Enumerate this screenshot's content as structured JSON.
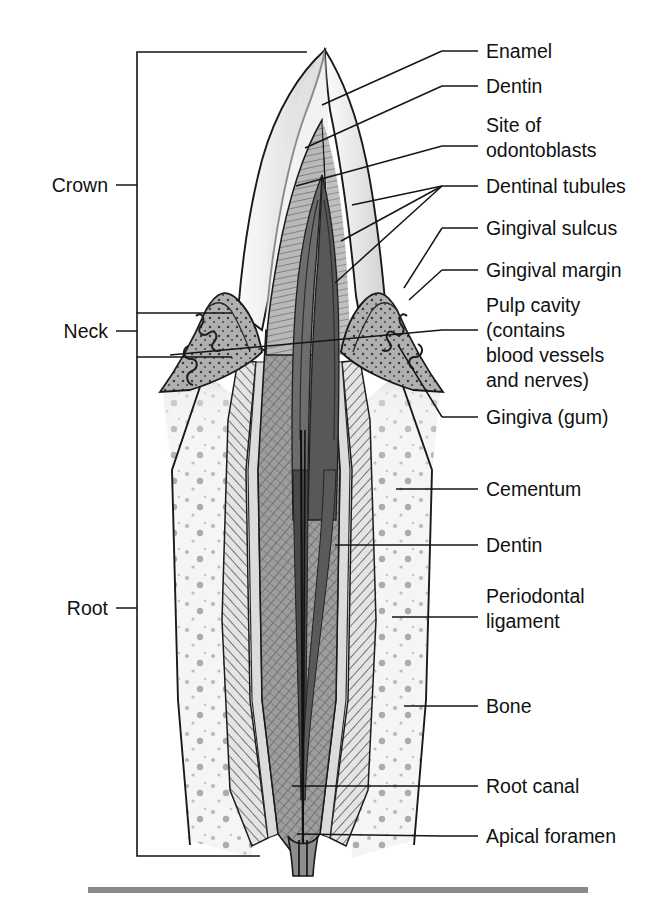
{
  "figure": {
    "background": "#ffffff",
    "ink": "#151515",
    "rule_color": "#8a8a8a"
  },
  "labels_right": [
    {
      "key": "enamel",
      "text": "Enamel",
      "lines": [
        "Enamel"
      ],
      "x": 486,
      "y": 58,
      "dash_x1": 442,
      "dash_x2": 478,
      "dash_y": 51
    },
    {
      "key": "dentin-crown",
      "text": "Dentin",
      "lines": [
        "Dentin"
      ],
      "x": 486,
      "y": 93,
      "dash_x1": 442,
      "dash_x2": 478,
      "dash_y": 86
    },
    {
      "key": "site-odontoblasts",
      "text": "Site of odontoblasts",
      "lines": [
        "Site of",
        "odontoblasts"
      ],
      "x": 486,
      "y": 132,
      "dash_x1": 442,
      "dash_x2": 478,
      "dash_y": 146
    },
    {
      "key": "dentinal-tubules",
      "text": "Dentinal tubules",
      "lines": [
        "Dentinal tubules"
      ],
      "x": 486,
      "y": 193,
      "dash_x1": 442,
      "dash_x2": 478,
      "dash_y": 186
    },
    {
      "key": "gingival-sulcus",
      "text": "Gingival sulcus",
      "lines": [
        "Gingival sulcus"
      ],
      "x": 486,
      "y": 235,
      "dash_x1": 442,
      "dash_x2": 478,
      "dash_y": 228
    },
    {
      "key": "gingival-margin",
      "text": "Gingival margin",
      "lines": [
        "Gingival margin"
      ],
      "x": 486,
      "y": 277,
      "dash_x1": 442,
      "dash_x2": 478,
      "dash_y": 270
    },
    {
      "key": "pulp-cavity",
      "text": "Pulp cavity (contains blood vessels and nerves)",
      "lines": [
        "Pulp cavity",
        "(contains",
        "blood vessels",
        "and nerves)"
      ],
      "x": 486,
      "y": 312,
      "dash_x1": 442,
      "dash_x2": 478,
      "dash_y": 330
    },
    {
      "key": "gingiva",
      "text": "Gingiva (gum)",
      "lines": [
        "Gingiva (gum)"
      ],
      "x": 486,
      "y": 424,
      "dash_x1": 442,
      "dash_x2": 478,
      "dash_y": 417
    },
    {
      "key": "cementum",
      "text": "Cementum",
      "lines": [
        "Cementum"
      ],
      "x": 486,
      "y": 496,
      "dash_x1": 442,
      "dash_x2": 478,
      "dash_y": 489
    },
    {
      "key": "dentin-root",
      "text": "Dentin",
      "lines": [
        "Dentin"
      ],
      "x": 486,
      "y": 552,
      "dash_x1": 442,
      "dash_x2": 478,
      "dash_y": 545
    },
    {
      "key": "periodontal-ligament",
      "text": "Periodontal ligament",
      "lines": [
        "Periodontal",
        "ligament"
      ],
      "x": 486,
      "y": 603,
      "dash_x1": 442,
      "dash_x2": 478,
      "dash_y": 617
    },
    {
      "key": "bone",
      "text": "Bone",
      "lines": [
        "Bone"
      ],
      "x": 486,
      "y": 713,
      "dash_x1": 442,
      "dash_x2": 478,
      "dash_y": 706
    },
    {
      "key": "root-canal",
      "text": "Root canal",
      "lines": [
        "Root canal"
      ],
      "x": 486,
      "y": 793,
      "dash_x1": 442,
      "dash_x2": 478,
      "dash_y": 786
    },
    {
      "key": "apical-foramen",
      "text": "Apical foramen",
      "lines": [
        "Apical foramen"
      ],
      "x": 486,
      "y": 843,
      "dash_x1": 442,
      "dash_x2": 478,
      "dash_y": 836
    }
  ],
  "labels_left": [
    {
      "key": "crown",
      "text": "Crown",
      "x": 108,
      "y": 192,
      "tick_x1": 116,
      "tick_x2": 137,
      "tick_y": 185
    },
    {
      "key": "neck",
      "text": "Neck",
      "x": 108,
      "y": 338,
      "tick_x1": 116,
      "tick_x2": 137,
      "tick_y": 331
    },
    {
      "key": "root",
      "text": "Root",
      "x": 108,
      "y": 615,
      "tick_x1": 116,
      "tick_x2": 137,
      "tick_y": 608
    }
  ],
  "brackets": [
    {
      "key": "crown-bracket",
      "d": "M 307 52 L 137 52 L 137 313"
    },
    {
      "key": "neck-bracket",
      "d": "M 232 313 L 137 313 L 137 357 L 232 357"
    },
    {
      "key": "root-bracket",
      "d": "M 137 357 L 137 856 L 260 856"
    }
  ],
  "leaders": [
    {
      "key": "leader-enamel",
      "d": "M 442 51 L 322 105"
    },
    {
      "key": "leader-dentin-crown",
      "d": "M 442 86 L 305 148"
    },
    {
      "key": "leader-odontoblasts",
      "d": "M 442 146 L 296 186"
    },
    {
      "key": "leader-tubules-a",
      "d": "M 442 186 L 352 205"
    },
    {
      "key": "leader-tubules-b",
      "d": "M 442 186 L 341 241"
    },
    {
      "key": "leader-tubules-c",
      "d": "M 442 186 L 335 283"
    },
    {
      "key": "leader-gingival-sulcus",
      "d": "M 442 228 L 404 288"
    },
    {
      "key": "leader-gingival-margin",
      "d": "M 442 270 L 409 300"
    },
    {
      "key": "leader-pulp-cavity",
      "d": "M 442 330 L 170 355"
    },
    {
      "key": "leader-gingiva",
      "d": "M 442 417 L 398 345"
    },
    {
      "key": "leader-cementum",
      "d": "M 442 489 L 396 489"
    },
    {
      "key": "leader-dentin-root",
      "d": "M 442 545 L 335 545"
    },
    {
      "key": "leader-periodontal",
      "d": "M 442 617 L 392 617"
    },
    {
      "key": "leader-bone",
      "d": "M 442 706 L 404 706"
    },
    {
      "key": "leader-root-canal",
      "d": "M 442 786 L 292 786"
    },
    {
      "key": "leader-apical-foramen",
      "d": "M 442 836 L 297 834"
    }
  ],
  "anatomy": {
    "enamel_fill": "#ececed",
    "dentin_fill": "#b9b9b9",
    "dentin_root_fill": "#9e9e9e",
    "pulp_fill": "#6a6a6a",
    "pulp_dark_fill": "#4f4f4f",
    "cementum_fill": "#d7d7d7",
    "pdl_fill": "#cfcfcf",
    "bone_fill": "#f1f1f1",
    "gingiva_fill": "#a9a9a9",
    "gingiva_light_fill": "#c6c6c6",
    "canal_fill": "#2a2a2a"
  },
  "bottom_rule": {
    "key": "bottom-rule",
    "x": 88,
    "y": 887,
    "width": 500,
    "height": 6
  }
}
